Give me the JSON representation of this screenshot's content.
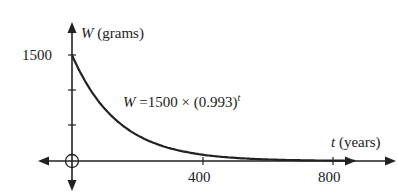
{
  "chart_data": {
    "type": "line",
    "title": "",
    "function": "W = 1500 × (0.993)^t",
    "equation_label": {
      "lhs": "W",
      "eq": "=1500 × (0.993)",
      "exp": "t"
    },
    "xlabel": {
      "var": "t",
      "unit": "(years)"
    },
    "ylabel": {
      "var": "W",
      "unit": "(grams)"
    },
    "x_ticks": [
      400,
      800
    ],
    "x_tick_labels": [
      "400",
      "800"
    ],
    "y_ticks": [
      500,
      1000,
      1500
    ],
    "y_tick_labels": [
      "1500"
    ],
    "xlim": [
      -100,
      1000
    ],
    "ylim": [
      -350,
      1900
    ],
    "grid": false,
    "legend": "none",
    "series": [
      {
        "name": "W = 1500 × (0.993)^t",
        "x": [
          0,
          50,
          100,
          150,
          200,
          300,
          400,
          500,
          600,
          700,
          800,
          850
        ],
        "values": [
          1500,
          1057,
          743,
          523,
          368,
          182,
          90,
          45,
          22,
          11,
          5,
          4
        ]
      }
    ],
    "origin_marker": "circle",
    "colors": {
      "curve": "#222222",
      "axis": "#222222"
    }
  }
}
